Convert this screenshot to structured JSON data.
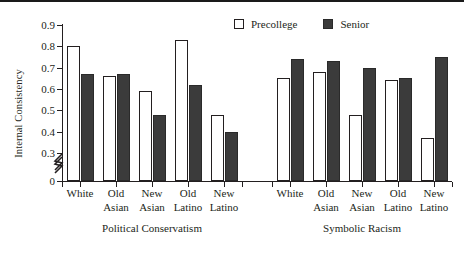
{
  "chart_data": {
    "type": "bar",
    "title": "",
    "subtitle": "",
    "xlabel": "",
    "ylabel": "Internal Consistency",
    "ylim": [
      0.3,
      0.9
    ],
    "y_axis_break": true,
    "y_axis_break_note": "axis broken between 0 and 0.3",
    "yticks": [
      "0.9",
      "0.8",
      "0.7",
      "0.6",
      "0.5",
      "0.4",
      "0.3",
      "0"
    ],
    "ytick_values": [
      0.9,
      0.8,
      0.7,
      0.6,
      0.5,
      0.4,
      0.3,
      0
    ],
    "grid": false,
    "legend_position": "top-right",
    "legend": [
      "Precollege",
      "Senior"
    ],
    "categories": [
      "White",
      "Old Asian",
      "New Asian",
      "Old Latino",
      "New Latino"
    ],
    "category_lines": [
      [
        "White",
        ""
      ],
      [
        "Old",
        "Asian"
      ],
      [
        "New",
        "Asian"
      ],
      [
        "Old",
        "Latino"
      ],
      [
        "New",
        "Latino"
      ]
    ],
    "groups": [
      {
        "name": "Political Conservatism",
        "series": [
          {
            "name": "Precollege",
            "values": [
              0.8,
              0.66,
              0.59,
              0.83,
              0.48
            ]
          },
          {
            "name": "Senior",
            "values": [
              0.67,
              0.67,
              0.48,
              0.62,
              0.4
            ]
          }
        ]
      },
      {
        "name": "Symbolic Racism",
        "series": [
          {
            "name": "Precollege",
            "values": [
              0.65,
              0.68,
              0.48,
              0.64,
              0.37
            ]
          },
          {
            "name": "Senior",
            "values": [
              0.74,
              0.73,
              0.7,
              0.65,
              0.75
            ]
          }
        ]
      }
    ],
    "colors": {
      "precollege": "#ffffff",
      "senior": "#3b3b3b",
      "axis": "#231f20",
      "background": "#ffffff"
    }
  }
}
